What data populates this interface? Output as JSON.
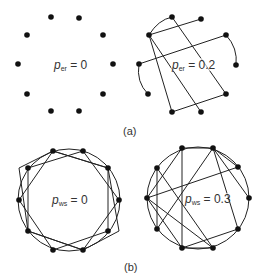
{
  "panels": {
    "a": {
      "caption": "(a)"
    },
    "b": {
      "caption": "(b)"
    },
    "er0": {
      "label_sym": "p",
      "label_sub": "er",
      "label_val": " = 0"
    },
    "er2": {
      "label_sym": "p",
      "label_sub": "er",
      "label_val": " = 0.2"
    },
    "ws0": {
      "label_sym": "p",
      "label_sub": "ws",
      "label_val": " = 0"
    },
    "ws3": {
      "label_sym": "p",
      "label_sub": "ws",
      "label_val": " = 0.3"
    }
  },
  "colors": {
    "node": "#111111",
    "edge": "#222222",
    "text": "#333333"
  }
}
